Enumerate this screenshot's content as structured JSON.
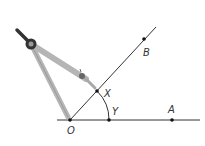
{
  "diagram": {
    "type": "geometric-construction",
    "points": {
      "O": {
        "label": "O",
        "x": 70,
        "y": 120
      },
      "Y": {
        "label": "Y",
        "x": 109,
        "y": 120
      },
      "A": {
        "label": "A",
        "x": 172,
        "y": 120
      },
      "X": {
        "label": "X",
        "x": 97,
        "y": 91
      },
      "B": {
        "label": "B",
        "x": 144,
        "y": 39
      }
    },
    "rays": [
      {
        "name": "OA",
        "from": "O",
        "through": "A"
      },
      {
        "name": "OB",
        "from": "O",
        "through": "B"
      }
    ],
    "arc": {
      "center": "O",
      "from": "X",
      "to": "Y"
    },
    "tool": {
      "name": "compass",
      "icon": "compass-icon"
    },
    "colors": {
      "line": "#333333",
      "compass_leg": "#b8b8b8",
      "compass_hinge": "#333333"
    }
  }
}
